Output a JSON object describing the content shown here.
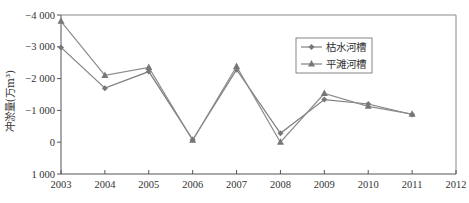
{
  "chart_data": {
    "type": "line",
    "title": "",
    "xlabel": "",
    "ylabel": "冲淤量(万m³)",
    "x": [
      2003,
      2004,
      2005,
      2006,
      2007,
      2008,
      2009,
      2010,
      2011
    ],
    "xticks": [
      "2003",
      "2004",
      "2005",
      "2006",
      "2007",
      "2008",
      "2009",
      "2010",
      "2011",
      "2012"
    ],
    "xlim": [
      2003,
      2012
    ],
    "yticks": [
      "-4 000",
      "-3 000",
      "-2 000",
      "-1 000",
      "0",
      "1 000"
    ],
    "ylim": [
      1000,
      -4000
    ],
    "y_axis_inverted": true,
    "grid": false,
    "legend_position": "upper right (inside plot)",
    "series": [
      {
        "name": "枯水河槽",
        "marker": "diamond",
        "color": "#7f7f7f",
        "values": [
          -2980,
          -1700,
          -2220,
          -80,
          -2280,
          -280,
          -1340,
          -1200,
          -870
        ]
      },
      {
        "name": "平滩河槽",
        "marker": "triangle",
        "color": "#8c8c8c",
        "values": [
          -3800,
          -2100,
          -2350,
          -60,
          -2380,
          0,
          -1530,
          -1130,
          -880
        ]
      }
    ]
  },
  "legend": {
    "items": [
      {
        "label": "枯水河槽",
        "marker": "diamond"
      },
      {
        "label": "平滩河槽",
        "marker": "triangle"
      }
    ]
  },
  "colors": {
    "axis": "#555555",
    "frame": "#888888",
    "line": "#808080"
  }
}
